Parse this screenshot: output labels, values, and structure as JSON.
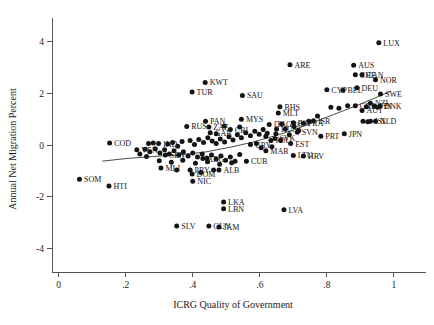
{
  "chart_data": {
    "type": "scatter",
    "title": "",
    "xlabel": "ICRG Quality of Government",
    "ylabel": "Annual Net Migration Percent",
    "xlim": [
      -0.02,
      1.06
    ],
    "ylim": [
      -4.9,
      4.6
    ],
    "xticks": [
      "0",
      ".2",
      ".4",
      ".6",
      ".8",
      "1"
    ],
    "xtick_values": [
      0,
      0.2,
      0.4,
      0.6,
      0.8,
      1.0
    ],
    "yticks": [
      "4",
      "2",
      "0",
      "-2",
      "-4"
    ],
    "ytick_values": [
      4,
      2,
      0,
      -2,
      -4
    ],
    "grid": false,
    "legend": "none",
    "marker_color": "#141414",
    "fit_line_color": "#4a4a4a",
    "fit_line": {
      "type": "lowess",
      "points": [
        [
          0.13,
          -0.62
        ],
        [
          0.2,
          -0.52
        ],
        [
          0.28,
          -0.44
        ],
        [
          0.36,
          -0.38
        ],
        [
          0.44,
          -0.26
        ],
        [
          0.52,
          -0.06
        ],
        [
          0.58,
          0.12
        ],
        [
          0.64,
          0.34
        ],
        [
          0.7,
          0.58
        ],
        [
          0.76,
          0.88
        ],
        [
          0.82,
          1.18
        ],
        [
          0.88,
          1.48
        ],
        [
          0.94,
          1.8
        ],
        [
          0.99,
          2.08
        ]
      ]
    },
    "points": [
      {
        "label": "LUX",
        "x": 0.955,
        "y": 3.95,
        "lp": "right"
      },
      {
        "label": "ARE",
        "x": 0.69,
        "y": 3.1,
        "lp": "right"
      },
      {
        "label": "AUS",
        "x": 0.88,
        "y": 3.08,
        "lp": "right"
      },
      {
        "label": "CHE",
        "x": 0.885,
        "y": 2.72,
        "lp": "right"
      },
      {
        "label": "CAN",
        "x": 0.905,
        "y": 2.72,
        "lp": "right"
      },
      {
        "label": "NOR",
        "x": 0.945,
        "y": 2.52,
        "lp": "right"
      },
      {
        "label": "KWT",
        "x": 0.437,
        "y": 2.42,
        "lp": "right"
      },
      {
        "label": "DEU",
        "x": 0.89,
        "y": 2.22,
        "lp": "right"
      },
      {
        "label": "CYP",
        "x": 0.8,
        "y": 2.14,
        "lp": "right"
      },
      {
        "label": "BEL",
        "x": 0.848,
        "y": 2.12,
        "lp": "right"
      },
      {
        "label": "TUR",
        "x": 0.398,
        "y": 2.05,
        "lp": "right"
      },
      {
        "label": "SWE",
        "x": 0.96,
        "y": 1.97,
        "lp": "right"
      },
      {
        "label": "SAU",
        "x": 0.548,
        "y": 1.92,
        "lp": "right"
      },
      {
        "label": "NZL",
        "x": 0.93,
        "y": 1.62,
        "lp": "right"
      },
      {
        "label": "GBR",
        "x": 0.885,
        "y": 1.52,
        "lp": "right"
      },
      {
        "label": "FIN",
        "x": 0.942,
        "y": 1.5,
        "lp": "right"
      },
      {
        "label": "DNK",
        "x": 0.958,
        "y": 1.5,
        "lp": "right"
      },
      {
        "label": "BHS",
        "x": 0.66,
        "y": 1.48,
        "lp": "right"
      },
      {
        "label": "AUT",
        "x": 0.905,
        "y": 1.34,
        "lp": "right"
      },
      {
        "label": "MLT",
        "x": 0.655,
        "y": 1.24,
        "lp": "right"
      },
      {
        "label": "ISR",
        "x": 0.76,
        "y": 0.94,
        "lp": "right"
      },
      {
        "label": "ISL",
        "x": 0.93,
        "y": 0.92,
        "lp": "right"
      },
      {
        "label": "NLD",
        "x": 0.945,
        "y": 0.92,
        "lp": "right"
      },
      {
        "label": "MYS",
        "x": 0.545,
        "y": 1.0,
        "lp": "right"
      },
      {
        "label": "PAN",
        "x": 0.438,
        "y": 0.92,
        "lp": "right"
      },
      {
        "label": "RUS",
        "x": 0.382,
        "y": 0.72,
        "lp": "right"
      },
      {
        "label": "ZAF",
        "x": 0.448,
        "y": 0.7,
        "lp": "right"
      },
      {
        "label": "CRI",
        "x": 0.512,
        "y": 0.6,
        "lp": "right"
      },
      {
        "label": "GAB",
        "x": 0.452,
        "y": 0.48,
        "lp": "right"
      },
      {
        "label": "JPN",
        "x": 0.852,
        "y": 0.44,
        "lp": "right"
      },
      {
        "label": "PRT",
        "x": 0.782,
        "y": 0.34,
        "lp": "right"
      },
      {
        "label": "SVN",
        "x": 0.712,
        "y": 0.5,
        "lp": "right"
      },
      {
        "label": "HUN",
        "x": 0.65,
        "y": 0.62,
        "lp": "right"
      },
      {
        "label": "ITA",
        "x": 0.628,
        "y": 0.8,
        "lp": "right"
      },
      {
        "label": "GRC",
        "x": 0.665,
        "y": 0.82,
        "lp": "right"
      },
      {
        "label": "ESP",
        "x": 0.7,
        "y": 0.86,
        "lp": "right"
      },
      {
        "label": "FRA",
        "x": 0.73,
        "y": 0.84,
        "lp": "right"
      },
      {
        "label": "COD",
        "x": 0.152,
        "y": 0.08,
        "lp": "right"
      },
      {
        "label": "IND",
        "x": 0.298,
        "y": 0.06,
        "lp": "right"
      },
      {
        "label": "VEN",
        "x": 0.233,
        "y": -0.18,
        "lp": "right"
      },
      {
        "label": "SVK",
        "x": 0.645,
        "y": 0.26,
        "lp": "right"
      },
      {
        "label": "EST",
        "x": 0.692,
        "y": 0.06,
        "lp": "right"
      },
      {
        "label": "POL",
        "x": 0.633,
        "y": 0.18,
        "lp": "right"
      },
      {
        "label": "URY",
        "x": 0.572,
        "y": 0.02,
        "lp": "right"
      },
      {
        "label": "MAR",
        "x": 0.618,
        "y": -0.22,
        "lp": "right"
      },
      {
        "label": "LTU",
        "x": 0.7,
        "y": -0.4,
        "lp": "right"
      },
      {
        "label": "HRV",
        "x": 0.73,
        "y": -0.42,
        "lp": "right"
      },
      {
        "label": "CUB",
        "x": 0.56,
        "y": -0.62,
        "lp": "right"
      },
      {
        "label": "ALB",
        "x": 0.478,
        "y": -0.96,
        "lp": "right"
      },
      {
        "label": "SEN",
        "x": 0.318,
        "y": -0.38,
        "lp": "right"
      },
      {
        "label": "ARG",
        "x": 0.43,
        "y": -0.52,
        "lp": "right"
      },
      {
        "label": "MLI",
        "x": 0.305,
        "y": -0.88,
        "lp": "right"
      },
      {
        "label": "PRY",
        "x": 0.392,
        "y": -0.96,
        "lp": "right"
      },
      {
        "label": "DOM",
        "x": 0.398,
        "y": -1.12,
        "lp": "right"
      },
      {
        "label": "NIC",
        "x": 0.4,
        "y": -1.4,
        "lp": "right"
      },
      {
        "label": "SOM",
        "x": 0.062,
        "y": -1.32,
        "lp": "right"
      },
      {
        "label": "HTI",
        "x": 0.15,
        "y": -1.58,
        "lp": "right"
      },
      {
        "label": "LKA",
        "x": 0.492,
        "y": -2.2,
        "lp": "right"
      },
      {
        "label": "LBN",
        "x": 0.492,
        "y": -2.46,
        "lp": "right"
      },
      {
        "label": "LVA",
        "x": 0.672,
        "y": -2.5,
        "lp": "right"
      },
      {
        "label": "SLV",
        "x": 0.352,
        "y": -3.12,
        "lp": "right"
      },
      {
        "label": "GUY",
        "x": 0.448,
        "y": -3.12,
        "lp": "right"
      },
      {
        "label": "JAM",
        "x": 0.478,
        "y": -3.16,
        "lp": "right"
      },
      {
        "label": "",
        "x": 0.268,
        "y": 0.06,
        "lp": "none"
      },
      {
        "label": "",
        "x": 0.282,
        "y": 0.08,
        "lp": "none"
      },
      {
        "label": "",
        "x": 0.325,
        "y": 0.04,
        "lp": "none"
      },
      {
        "label": "",
        "x": 0.34,
        "y": 0.1,
        "lp": "none"
      },
      {
        "label": "",
        "x": 0.355,
        "y": -0.04,
        "lp": "none"
      },
      {
        "label": "",
        "x": 0.368,
        "y": 0.14,
        "lp": "none"
      },
      {
        "label": "",
        "x": 0.392,
        "y": 0.18,
        "lp": "none"
      },
      {
        "label": "",
        "x": 0.405,
        "y": 0.02,
        "lp": "none"
      },
      {
        "label": "",
        "x": 0.418,
        "y": 0.22,
        "lp": "none"
      },
      {
        "label": "",
        "x": 0.432,
        "y": 0.1,
        "lp": "none"
      },
      {
        "label": "",
        "x": 0.445,
        "y": 0.28,
        "lp": "none"
      },
      {
        "label": "",
        "x": 0.458,
        "y": 0.16,
        "lp": "none"
      },
      {
        "label": "",
        "x": 0.47,
        "y": 0.06,
        "lp": "none"
      },
      {
        "label": "",
        "x": 0.482,
        "y": 0.24,
        "lp": "none"
      },
      {
        "label": "",
        "x": 0.495,
        "y": 0.12,
        "lp": "none"
      },
      {
        "label": "",
        "x": 0.508,
        "y": 0.32,
        "lp": "none"
      },
      {
        "label": "",
        "x": 0.52,
        "y": 0.2,
        "lp": "none"
      },
      {
        "label": "",
        "x": 0.533,
        "y": 0.4,
        "lp": "none"
      },
      {
        "label": "",
        "x": 0.545,
        "y": 0.28,
        "lp": "none"
      },
      {
        "label": "",
        "x": 0.558,
        "y": 0.48,
        "lp": "none"
      },
      {
        "label": "",
        "x": 0.572,
        "y": 0.36,
        "lp": "none"
      },
      {
        "label": "",
        "x": 0.585,
        "y": 0.54,
        "lp": "none"
      },
      {
        "label": "",
        "x": 0.598,
        "y": 0.42,
        "lp": "none"
      },
      {
        "label": "",
        "x": 0.61,
        "y": 0.6,
        "lp": "none"
      },
      {
        "label": "",
        "x": 0.622,
        "y": 0.46,
        "lp": "none"
      },
      {
        "label": "",
        "x": 0.258,
        "y": -0.16,
        "lp": "none"
      },
      {
        "label": "",
        "x": 0.272,
        "y": -0.26,
        "lp": "none"
      },
      {
        "label": "",
        "x": 0.288,
        "y": -0.14,
        "lp": "none"
      },
      {
        "label": "",
        "x": 0.302,
        "y": -0.3,
        "lp": "none"
      },
      {
        "label": "",
        "x": 0.316,
        "y": -0.18,
        "lp": "none"
      },
      {
        "label": "",
        "x": 0.33,
        "y": -0.34,
        "lp": "none"
      },
      {
        "label": "",
        "x": 0.344,
        "y": -0.22,
        "lp": "none"
      },
      {
        "label": "",
        "x": 0.358,
        "y": -0.38,
        "lp": "none"
      },
      {
        "label": "",
        "x": 0.372,
        "y": -0.26,
        "lp": "none"
      },
      {
        "label": "",
        "x": 0.386,
        "y": -0.42,
        "lp": "none"
      },
      {
        "label": "",
        "x": 0.4,
        "y": -0.3,
        "lp": "none"
      },
      {
        "label": "",
        "x": 0.414,
        "y": -0.46,
        "lp": "none"
      },
      {
        "label": "",
        "x": 0.428,
        "y": -0.34,
        "lp": "none"
      },
      {
        "label": "",
        "x": 0.442,
        "y": -0.5,
        "lp": "none"
      },
      {
        "label": "",
        "x": 0.456,
        "y": -0.38,
        "lp": "none"
      },
      {
        "label": "",
        "x": 0.47,
        "y": -0.54,
        "lp": "none"
      },
      {
        "label": "",
        "x": 0.484,
        "y": -0.42,
        "lp": "none"
      },
      {
        "label": "",
        "x": 0.498,
        "y": -0.58,
        "lp": "none"
      },
      {
        "label": "",
        "x": 0.512,
        "y": -0.46,
        "lp": "none"
      },
      {
        "label": "",
        "x": 0.526,
        "y": -0.62,
        "lp": "none"
      },
      {
        "label": "",
        "x": 0.54,
        "y": -0.36,
        "lp": "none"
      },
      {
        "label": "",
        "x": 0.3,
        "y": -0.6,
        "lp": "none"
      },
      {
        "label": "",
        "x": 0.336,
        "y": -0.66,
        "lp": "none"
      },
      {
        "label": "",
        "x": 0.37,
        "y": -0.58,
        "lp": "none"
      },
      {
        "label": "",
        "x": 0.408,
        "y": -0.7,
        "lp": "none"
      },
      {
        "label": "",
        "x": 0.444,
        "y": -0.64,
        "lp": "none"
      },
      {
        "label": "",
        "x": 0.48,
        "y": -0.74,
        "lp": "none"
      },
      {
        "label": "",
        "x": 0.516,
        "y": -0.68,
        "lp": "none"
      },
      {
        "label": "",
        "x": 0.59,
        "y": 0.06,
        "lp": "none"
      },
      {
        "label": "",
        "x": 0.604,
        "y": -0.1,
        "lp": "none"
      },
      {
        "label": "",
        "x": 0.618,
        "y": 0.34,
        "lp": "none"
      },
      {
        "label": "",
        "x": 0.636,
        "y": -0.06,
        "lp": "none"
      },
      {
        "label": "",
        "x": 0.648,
        "y": 0.44,
        "lp": "none"
      },
      {
        "label": "",
        "x": 0.662,
        "y": 0.18,
        "lp": "none"
      },
      {
        "label": "",
        "x": 0.676,
        "y": 0.62,
        "lp": "none"
      },
      {
        "label": "",
        "x": 0.688,
        "y": 0.4,
        "lp": "none"
      },
      {
        "label": "",
        "x": 0.702,
        "y": 0.72,
        "lp": "none"
      },
      {
        "label": "",
        "x": 0.716,
        "y": 0.56,
        "lp": "none"
      },
      {
        "label": "",
        "x": 0.746,
        "y": 0.92,
        "lp": "none"
      },
      {
        "label": "",
        "x": 0.772,
        "y": 1.12,
        "lp": "none"
      },
      {
        "label": "",
        "x": 0.812,
        "y": 1.46,
        "lp": "none"
      },
      {
        "label": "",
        "x": 0.836,
        "y": 1.42,
        "lp": "none"
      },
      {
        "label": "",
        "x": 0.862,
        "y": 1.52,
        "lp": "none"
      },
      {
        "label": "",
        "x": 0.918,
        "y": 1.48,
        "lp": "none"
      },
      {
        "label": "",
        "x": 0.952,
        "y": 1.46,
        "lp": "none"
      },
      {
        "label": "",
        "x": 0.908,
        "y": 0.92,
        "lp": "none"
      },
      {
        "label": "",
        "x": 0.922,
        "y": 0.9,
        "lp": "none"
      },
      {
        "label": "",
        "x": 0.262,
        "y": -0.44,
        "lp": "none"
      },
      {
        "label": "",
        "x": 0.242,
        "y": -0.34,
        "lp": "none"
      },
      {
        "label": "",
        "x": 0.352,
        "y": -0.96,
        "lp": "none"
      },
      {
        "label": "",
        "x": 0.424,
        "y": -1.06,
        "lp": "none"
      },
      {
        "label": "",
        "x": 0.462,
        "y": -0.96,
        "lp": "none"
      },
      {
        "label": "",
        "x": 0.54,
        "y": 0.7,
        "lp": "none"
      },
      {
        "label": "",
        "x": 0.494,
        "y": 0.74,
        "lp": "none"
      },
      {
        "label": "",
        "x": 0.47,
        "y": 0.44,
        "lp": "none"
      }
    ]
  }
}
